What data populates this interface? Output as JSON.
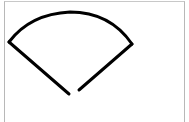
{
  "canvas": {
    "background": "#ffffff",
    "border_color": "#b8b8b8"
  },
  "drawing": {
    "shape": "sector-fan-sketch",
    "stroke_color": "#000000",
    "stroke_width": 3,
    "arc_path": "M 9 42 Q 30 14 70 12 Q 110 12 132 44",
    "left_line": "M 9 42 L 69 94",
    "right_line": "M 132 44 L 79 90"
  }
}
